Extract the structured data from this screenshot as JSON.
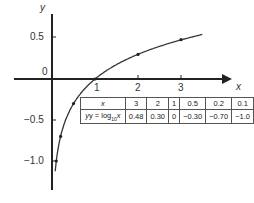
{
  "chart_data": {
    "type": "line",
    "title": "",
    "xlabel": "x",
    "ylabel": "y",
    "function": "y = log10 x",
    "x_ticks": [
      "1",
      "2",
      "3"
    ],
    "y_ticks": [
      "0.5",
      "0",
      "-0.5",
      "-1.0"
    ],
    "xlim": [
      -0.9,
      3.6
    ],
    "ylim": [
      -1.35,
      0.9
    ],
    "grid": false,
    "series": [
      {
        "name": "y = log10 x",
        "x": [
          0.1,
          0.2,
          0.5,
          1,
          2,
          3
        ],
        "y": [
          -1.0,
          -0.7,
          -0.3,
          0,
          0.3,
          0.48
        ]
      }
    ],
    "table": {
      "header": "x",
      "row_label": "y = log10 x",
      "x_values": [
        "3",
        "2",
        "1",
        "0.5",
        "0.2",
        "0.1"
      ],
      "y_values": [
        "0.48",
        "0.30",
        "0",
        "−0.30",
        "−0.70",
        "−1.0"
      ]
    }
  },
  "labels": {
    "x_axis": "x",
    "y_axis": "y",
    "y05": "0.5",
    "y0": "0",
    "ym05": "−0.5",
    "ym10": "−1.0",
    "x1": "1",
    "x2": "2",
    "x3": "3",
    "table_x": "x",
    "table_y_prefix": "y = log",
    "table_y_sub": "10",
    "table_y_suffix": "x",
    "xv0": "3",
    "xv1": "2",
    "xv2": "1",
    "xv3": "0.5",
    "xv4": "0.2",
    "xv5": "0.1",
    "yv0": "0.48",
    "yv1": "0.30",
    "yv2": "0",
    "yv3": "−0.30",
    "yv4": "−0.70",
    "yv5": "−1.0"
  }
}
